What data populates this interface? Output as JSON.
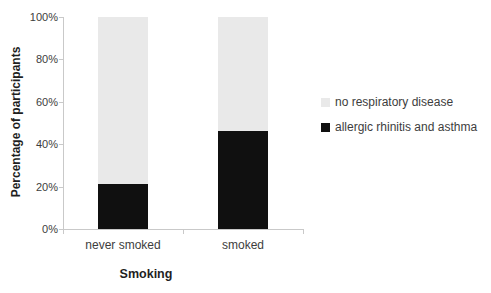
{
  "chart_data": {
    "type": "bar",
    "stacked": true,
    "units": "percent",
    "categories": [
      "never smoked",
      "smoked"
    ],
    "series": [
      {
        "name": "allergic rhinitis and asthma",
        "color": "#101010",
        "values": [
          21,
          46
        ]
      },
      {
        "name": "no respiratory disease",
        "color": "#e9e9e9",
        "values": [
          79,
          54
        ]
      }
    ],
    "xlabel": "Smoking",
    "ylabel": "Percentage of participants",
    "ylim": [
      0,
      100
    ],
    "yticks": [
      "0%",
      "20%",
      "40%",
      "60%",
      "80%",
      "100%"
    ],
    "grid": false,
    "legend_position": "right"
  },
  "colors": {
    "axis": "#c9c9c9",
    "tick_text": "#3d3d3d",
    "title_text": "#1f1f1f",
    "background": "#ffffff"
  }
}
